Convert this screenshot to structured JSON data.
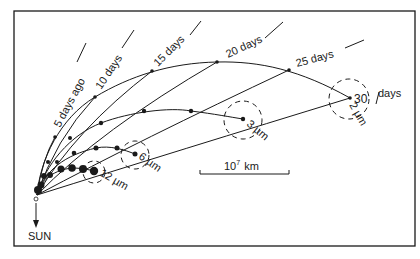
{
  "figure": {
    "type": "dust tail synchrone/syndyne diagram",
    "border_color": "#1a1a1a",
    "background": "#ffffff"
  },
  "syndynes": [
    {
      "size_label": "2 µm",
      "points": [
        [
          37,
          195
        ],
        [
          55,
          137
        ],
        [
          95,
          97
        ],
        [
          152,
          71
        ],
        [
          217,
          62
        ],
        [
          289,
          70
        ],
        [
          350,
          98
        ]
      ]
    },
    {
      "size_label": "3 µm",
      "points": [
        [
          37,
          195
        ],
        [
          48,
          162
        ],
        [
          70,
          138
        ],
        [
          101,
          123
        ],
        [
          144,
          111
        ],
        [
          191,
          111
        ],
        [
          243,
          119
        ]
      ]
    },
    {
      "size_label": "6 µm",
      "points": [
        [
          37,
          195
        ],
        [
          44,
          176
        ],
        [
          57,
          162
        ],
        [
          74,
          153
        ],
        [
          96,
          148
        ],
        [
          117,
          148
        ],
        [
          135,
          154
        ]
      ]
    },
    {
      "size_label": "12 µm",
      "points": [
        [
          37,
          195
        ],
        [
          41,
          185
        ],
        [
          50,
          175
        ],
        [
          61,
          169
        ],
        [
          72,
          168
        ],
        [
          83,
          169
        ],
        [
          94,
          171
        ]
      ]
    }
  ],
  "synchrones": [
    {
      "label": "5 days ago",
      "age_days": 5,
      "end": [
        55,
        137
      ]
    },
    {
      "label": "10 days",
      "age_days": 10,
      "end": [
        95,
        97
      ]
    },
    {
      "label": "15 days",
      "age_days": 15,
      "end": [
        152,
        71
      ]
    },
    {
      "label": "20 days",
      "age_days": 20,
      "end": [
        217,
        62
      ]
    },
    {
      "label": "25 days",
      "age_days": 25,
      "end": [
        289,
        70
      ]
    },
    {
      "label": "30 days",
      "age_days": 30,
      "end": [
        350,
        98
      ]
    }
  ],
  "labels": {
    "d5": "5 days ago",
    "d10": "10 days",
    "d15": "15 days",
    "d20": "20 days",
    "d25": "25 days",
    "d30_num": "30",
    "d30_unit": "days",
    "um2": "2 µm",
    "um3": "3 µm",
    "um6": "6 µm",
    "um12": "12 µm",
    "scale_base": "10",
    "scale_exp": "7",
    "scale_unit": "km",
    "sun": "SUN"
  },
  "scale_bar": {
    "x1": 200,
    "x2": 289,
    "y": 172,
    "value": "10^7 km"
  }
}
